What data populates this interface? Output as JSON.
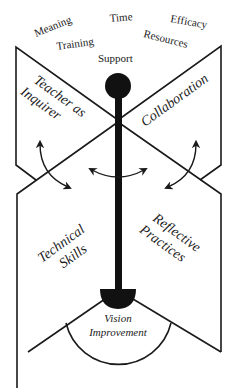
{
  "diagram": {
    "top_labels": [
      {
        "text": "Meaning",
        "x": 34,
        "y": 35,
        "rotate": -22
      },
      {
        "text": "Time",
        "x": 110,
        "y": 22,
        "rotate": -5
      },
      {
        "text": "Efficacy",
        "x": 170,
        "y": 23,
        "rotate": 10
      },
      {
        "text": "Training",
        "x": 56,
        "y": 50,
        "rotate": -8
      },
      {
        "text": "Resources",
        "x": 142,
        "y": 38,
        "rotate": 14
      },
      {
        "text": "Support",
        "x": 98,
        "y": 62,
        "rotate": 0
      }
    ],
    "panels": {
      "upper_left": {
        "line1": "Teacher as",
        "line2": "Inquirer"
      },
      "upper_right": {
        "label": "Collaboration"
      },
      "lower_left": {
        "line1": "Technical",
        "line2": "Skills"
      },
      "lower_right": {
        "line1": "Reflective",
        "line2": "Practices"
      }
    },
    "base": {
      "line1": "Vision",
      "line2": "Improvement"
    },
    "colors": {
      "ink": "#1a1a1a",
      "background": "#ffffff"
    }
  }
}
